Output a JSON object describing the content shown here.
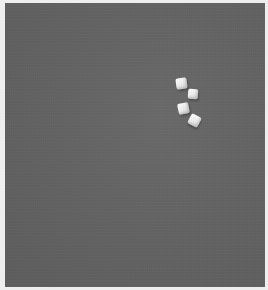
{
  "image": {
    "description": "Grayscale photograph of four white sugar cubes on a plain gray surface",
    "background_color": "#646464",
    "frame_color": "#eeeeee",
    "objects": [
      {
        "type": "sugar-cube",
        "label": "cube 1"
      },
      {
        "type": "sugar-cube",
        "label": "cube 2"
      },
      {
        "type": "sugar-cube",
        "label": "cube 3"
      },
      {
        "type": "sugar-cube",
        "label": "cube 4"
      }
    ],
    "object_count": 4
  }
}
